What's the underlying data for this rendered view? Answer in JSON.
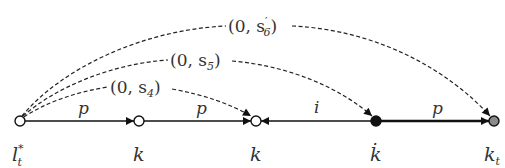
{
  "diagram": {
    "nodes": [
      {
        "id": "n1",
        "label": "l",
        "sup": "*",
        "sub": "t",
        "x": 20,
        "y": 121,
        "fill": "#ffffff"
      },
      {
        "id": "n2",
        "label": "k",
        "x": 139,
        "y": 121,
        "fill": "#ffffff"
      },
      {
        "id": "n3",
        "label": "k",
        "x": 256,
        "y": 121,
        "fill": "#ffffff"
      },
      {
        "id": "n4",
        "label": "k̇",
        "x": 376,
        "y": 121,
        "fill": "#111111"
      },
      {
        "id": "n5",
        "label": "k",
        "sub": "t",
        "x": 494,
        "y": 121,
        "fill": "#8a8a8a"
      }
    ],
    "straight_edges": [
      {
        "from": "n1",
        "to": "n2",
        "label": "p"
      },
      {
        "from": "n2",
        "to": "n3",
        "label": "p"
      },
      {
        "from": "n4",
        "to": "n3",
        "label": "i"
      },
      {
        "from": "n4",
        "to": "n5",
        "label": "p",
        "bold": true
      }
    ],
    "dashed_arcs": [
      {
        "from": "n1",
        "to": "n3",
        "label_main": "(0, s",
        "label_sub": "4",
        "label_prime": "",
        "label_close": ")"
      },
      {
        "from": "n1",
        "to": "n4",
        "label_main": "(0, s",
        "label_sub": "5",
        "label_prime": "",
        "label_close": ")"
      },
      {
        "from": "n1",
        "to": "n5",
        "label_main": "(0, s",
        "label_sub": "6",
        "label_prime": "′",
        "label_close": ")"
      }
    ]
  }
}
